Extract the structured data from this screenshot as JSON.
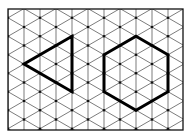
{
  "diagram": {
    "type": "isometric-dot-grid",
    "grid": {
      "columns": 11,
      "line_color": "#444444",
      "dot_color": "#111111",
      "frame_color": "#111111"
    },
    "shapes": [
      {
        "name": "triangle",
        "kind": "equilateral-triangle",
        "side_in_grid_units": 3,
        "orientation": "pointing-left",
        "stroke_color": "#000000"
      },
      {
        "name": "hexagon",
        "kind": "regular-hexagon",
        "side_in_grid_units": 2,
        "orientation": "pointy-top",
        "stroke_color": "#000000"
      }
    ]
  }
}
